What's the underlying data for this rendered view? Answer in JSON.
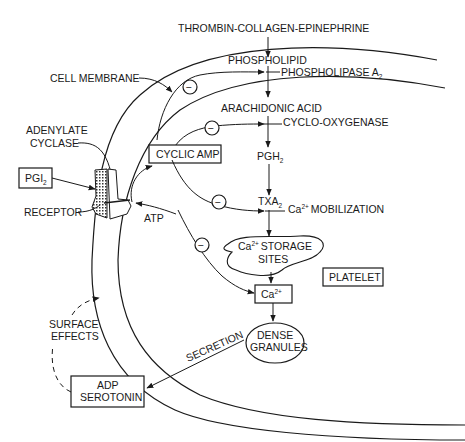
{
  "diagram": {
    "type": "platelet-activation-pathway",
    "labels": {
      "stimuli": "THROMBIN-COLLAGEN-EPINEPHRINE",
      "phospholipid": "PHOSPHOLIPID",
      "phospholipase": "PHOSPHOLIPASE A",
      "phospholipase_sub": "2",
      "cell_membrane": "CELL MEMBRANE",
      "arachidonic_acid": "ARACHIDONIC ACID",
      "cyclo_oxygenase": "CYCLO-OXYGENASE",
      "adenylate_cyclase_line1": "ADENYLATE",
      "adenylate_cyclase_line2": "CYCLASE",
      "cyclic_amp": "CYCLIC AMP",
      "pgh": "PGH",
      "pgh_sub": "2",
      "pgi": "PGI",
      "pgi_sub": "2",
      "txa": "TXA",
      "txa_sub": "2",
      "receptor": "RECEPTOR",
      "atp": "ATP",
      "ca_mobilization_prefix": "Ca",
      "ca_mobilization_sup": "2+",
      "ca_mobilization_text": "MOBILIZATION",
      "storage_prefix": "Ca",
      "storage_sup": "2+",
      "storage_line1": "STORAGE",
      "storage_line2": "SITES",
      "platelet": "PLATELET",
      "ca_box_prefix": "Ca",
      "ca_box_sup": "2+",
      "surface_effects_line1": "SURFACE",
      "surface_effects_line2": "EFFECTS",
      "dense_granules_line1": "DENSE",
      "dense_granules_line2": "GRANULES",
      "secretion": "SECRETION",
      "adp_serotonin_line1": "ADP",
      "adp_serotonin_line2": "SEROTONIN",
      "inhibit_symbol": "−"
    },
    "colors": {
      "ink": "#1a1a1a",
      "background": "#ffffff"
    }
  }
}
